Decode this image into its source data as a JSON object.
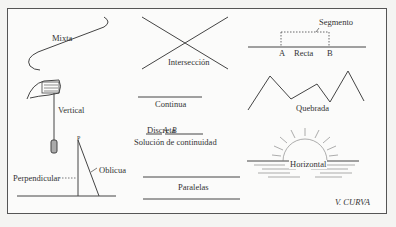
{
  "diagram": {
    "labels": {
      "mixta": "Mixta",
      "vertical": "Vertical",
      "perpendicular": "Perpendicular",
      "oblicua": "Oblicua",
      "point_p": "P",
      "interseccion": "Intersección",
      "continua": "Continua",
      "discreta": "Discreta",
      "point_a_discreta": "A",
      "point_b_discreta": "B",
      "solucion": "Solución de continuidad",
      "paralelas": "Paralelas",
      "segmento": "Segmento",
      "point_a": "A",
      "recta": "Recta",
      "point_b": "B",
      "quebrada": "Quebrada",
      "horizontal": "Horizontal",
      "curva": "V. CURVA"
    }
  }
}
